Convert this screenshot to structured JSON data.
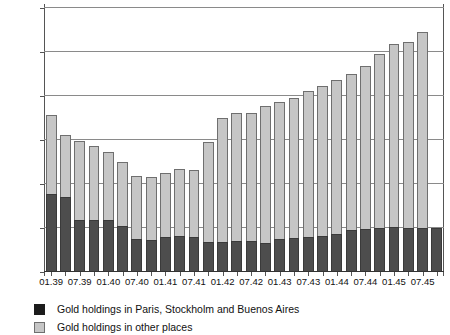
{
  "chart_data": {
    "type": "bar",
    "stacked": true,
    "title": "",
    "subtitle": "",
    "xlabel": "",
    "ylabel": "",
    "ylim": [
      0,
      1200
    ],
    "ytick_values": [
      0,
      200,
      400,
      600,
      800,
      1000,
      1200
    ],
    "ytick_labels": [
      "0",
      "200",
      "400",
      "600",
      "800",
      "1000",
      "1200"
    ],
    "grid": true,
    "legend_position": "bottom-left",
    "categories": [
      "01.39",
      "04.39",
      "07.39",
      "10.39",
      "01.40",
      "04.40",
      "07.40",
      "10.40",
      "01.41",
      "04.41",
      "07.41",
      "10.41",
      "01.42",
      "04.42",
      "07.42",
      "10.42",
      "01.43",
      "04.43",
      "07.43",
      "10.43",
      "01.44",
      "04.44",
      "07.44",
      "10.44",
      "01.45",
      "04.45",
      "07.45",
      "10.45"
    ],
    "xtick_labels_shown": [
      "01.39",
      "07.39",
      "01.40",
      "07.40",
      "01.41",
      "07.41",
      "01.42",
      "07.42",
      "01.43",
      "07.43",
      "01.44",
      "07.44",
      "01.45",
      "07.45"
    ],
    "series": [
      {
        "name": "Gold holdings in Paris, Stockholm and Buenos Aires",
        "color": "#4d4d4d",
        "values": [
          355,
          340,
          235,
          235,
          235,
          210,
          150,
          145,
          160,
          165,
          160,
          135,
          135,
          140,
          140,
          130,
          150,
          155,
          160,
          165,
          175,
          190,
          195,
          200,
          205,
          200,
          200,
          200
        ]
      },
      {
        "name": "Gold holdings in other places",
        "color": "#c6c6c6",
        "values": [
          360,
          285,
          360,
          340,
          310,
          290,
          285,
          285,
          290,
          305,
          305,
          455,
          565,
          585,
          585,
          625,
          625,
          635,
          665,
          680,
          700,
          710,
          740,
          790,
          830,
          845,
          890,
          0
        ]
      }
    ],
    "totals": [
      715,
      625,
      595,
      575,
      545,
      500,
      435,
      430,
      450,
      470,
      465,
      590,
      700,
      725,
      725,
      755,
      775,
      790,
      825,
      845,
      875,
      900,
      935,
      990,
      1035,
      1045,
      1090,
      0
    ]
  },
  "legend": {
    "items": [
      {
        "label": "Gold holdings in Paris, Stockholm and Buenos Aires",
        "swatch": "dark"
      },
      {
        "label": "Gold holdings in other places",
        "swatch": "light"
      }
    ]
  }
}
